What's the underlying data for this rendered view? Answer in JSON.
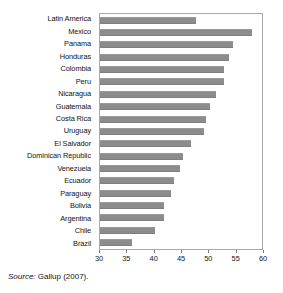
{
  "chart_data": {
    "type": "bar",
    "orientation": "horizontal",
    "title": "",
    "subtitle": "",
    "xlabel": "",
    "ylabel": "",
    "xlim": [
      30,
      60
    ],
    "xticks": [
      30,
      35,
      40,
      45,
      50,
      55,
      60
    ],
    "xtick_labels": [
      "30",
      "35",
      "40",
      "45",
      "50",
      "55",
      "60"
    ],
    "grid": false,
    "legend": null,
    "bar_color": "#8c8c8c",
    "frame_color": "#a9a9a9",
    "categories": [
      "Latin America",
      "Mexico",
      "Panama",
      "Honduras",
      "Colombia",
      "Peru",
      "Nicaragua",
      "Guatemala",
      "Costa Rica",
      "Uruguay",
      "El Salvador",
      "Dominican Republic",
      "Venezuela",
      "Ecuador",
      "Paraguay",
      "Bolivia",
      "Argentina",
      "Chile",
      "Brazil"
    ],
    "values": [
      47.7,
      58.2,
      54.6,
      53.8,
      53.0,
      52.9,
      51.4,
      50.4,
      49.6,
      49.3,
      46.8,
      45.4,
      44.9,
      43.7,
      43.1,
      41.9,
      41.8,
      40.1,
      36.0
    ]
  },
  "source": {
    "prefix": "Source:",
    "text": " Gallup (2007)."
  }
}
